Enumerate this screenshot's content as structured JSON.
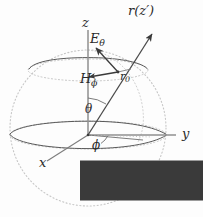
{
  "figure": {
    "background_color": "#fdfdfd",
    "ink_color": "#3a3a3a",
    "faint_color": "#c9c9c9",
    "labels": {
      "z_axis": "z",
      "y_axis": "y",
      "x_axis": "x",
      "ray": "r(z′)",
      "point": "r",
      "point_sub": "0",
      "e_field": "E",
      "e_field_sub": "θ",
      "h_field": "H",
      "h_field_sub": "ϕ",
      "theta": "θ",
      "phi": "ϕ"
    },
    "geometry": {
      "origin": [
        88,
        135
      ],
      "sphere_center": [
        88,
        128
      ],
      "sphere_radius": 78,
      "point_r0": [
        118,
        72
      ],
      "z_axis_top": [
        88,
        30
      ],
      "y_axis_end": [
        176,
        135
      ],
      "x_axis_end": [
        47,
        161
      ],
      "ray_tip": [
        152,
        34
      ],
      "e_arrow_tip": [
        97,
        47
      ],
      "h_arrow_tip": [
        88,
        78
      ],
      "theta_value_deg": 29,
      "phi_value_deg": 28
    }
  }
}
